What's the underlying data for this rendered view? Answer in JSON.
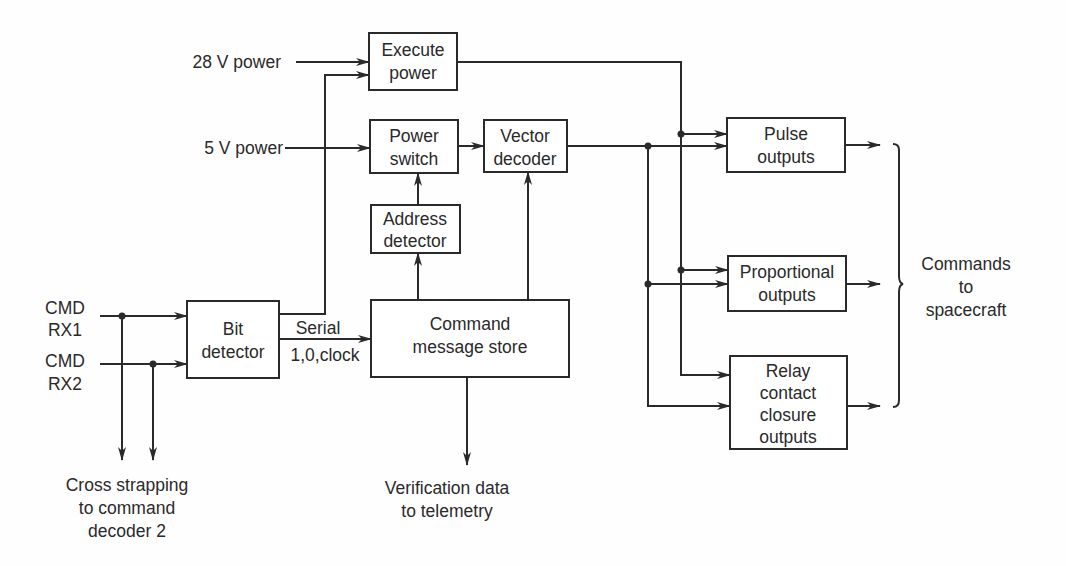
{
  "diagram": {
    "blocks": {
      "execute_power": {
        "lines": [
          "Execute",
          "power"
        ],
        "x": 369,
        "y": 33,
        "w": 88,
        "h": 57
      },
      "power_switch": {
        "lines": [
          "Power",
          "switch"
        ],
        "x": 370,
        "y": 120,
        "w": 88,
        "h": 53
      },
      "vector_decoder": {
        "lines": [
          "Vector",
          "decoder"
        ],
        "x": 484,
        "y": 120,
        "w": 83,
        "h": 52
      },
      "address_detector": {
        "lines": [
          "Address",
          "detector"
        ],
        "x": 371,
        "y": 205,
        "w": 89,
        "h": 48
      },
      "bit_detector": {
        "lines": [
          "Bit",
          "detector"
        ],
        "x": 187,
        "y": 301,
        "w": 92,
        "h": 77
      },
      "command_message_store": {
        "lines": [
          "Command",
          "message store"
        ],
        "x": 371,
        "y": 300,
        "w": 198,
        "h": 77
      },
      "pulse_outputs": {
        "lines": [
          "Pulse",
          "outputs"
        ],
        "x": 727,
        "y": 118,
        "w": 118,
        "h": 54
      },
      "proportional_outputs": {
        "lines": [
          "Proportional",
          "outputs"
        ],
        "x": 728,
        "y": 256,
        "w": 118,
        "h": 55
      },
      "relay_outputs": {
        "lines": [
          "Relay",
          "contact",
          "closure",
          "outputs"
        ],
        "x": 730,
        "y": 356,
        "w": 117,
        "h": 93
      }
    },
    "inputs": {
      "power_28v": "28 V power",
      "power_5v": "5 V power",
      "cmd_rx1": [
        "CMD",
        "RX1"
      ],
      "cmd_rx2": [
        "CMD",
        "RX2"
      ]
    },
    "signal_labels": {
      "serial": "Serial",
      "serial_sub": "1,0,clock"
    },
    "outputs": {
      "cross_strapping": [
        "Cross strapping",
        "to command",
        "decoder 2"
      ],
      "verification": [
        "Verification data",
        "to telemetry"
      ],
      "commands": [
        "Commands",
        "to",
        "spacecraft"
      ]
    },
    "colors": {
      "ink": "#2a2a2a",
      "background": "#fefefe"
    }
  }
}
